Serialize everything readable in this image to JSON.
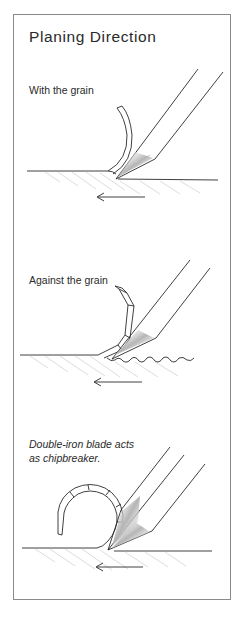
{
  "title": "Planing Direction",
  "panels": [
    {
      "id": "with-grain",
      "caption": "With the grain",
      "arrow_direction": "left"
    },
    {
      "id": "against-grain",
      "caption": "Against the grain",
      "arrow_direction": "left"
    },
    {
      "id": "double-iron",
      "caption_line1": "Double-iron blade acts",
      "caption_line2": "as chipbreaker.",
      "arrow_direction": "left"
    }
  ],
  "colors": {
    "border": "#8a8a8a",
    "ink": "#2a2a2a",
    "hatch": "#bdbdbd",
    "shade": "#9a9a9a"
  }
}
